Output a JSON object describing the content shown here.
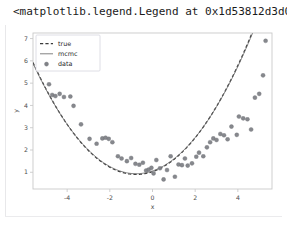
{
  "output": {
    "repr_text": "<matplotlib.legend.Legend at 0x1d53812d3d0>"
  },
  "colors": {
    "background": "#ffffff",
    "text": "#1a1a1a",
    "spine": "#c9c9c9",
    "tick_text": "#4d4d4d",
    "marker": "#808287",
    "marker_edge": "#6f7277",
    "true_line": "#3b3b3b",
    "mcmc_line": "#6a6a6a",
    "legend_border": "#d6d6de",
    "legend_face": "#ffffff",
    "cell_rule": "#e8e8ea"
  },
  "legend": {
    "entries": [
      {
        "label": "true",
        "style": "dashed-line",
        "color": "#3b3b3b"
      },
      {
        "label": "mcmc",
        "style": "solid-line",
        "color": "#6a6a6a"
      },
      {
        "label": "data",
        "style": "marker",
        "color": "#808287"
      }
    ]
  },
  "chart_data": {
    "type": "scatter",
    "title": "",
    "xlabel": "x",
    "ylabel": "y",
    "xlim": [
      -5.6,
      5.6
    ],
    "ylim": [
      0.25,
      7.25
    ],
    "xticks": [
      -4,
      -2,
      0,
      2,
      4
    ],
    "yticks": [
      1,
      2,
      3,
      4,
      5,
      6,
      7
    ],
    "xticklabels": [
      "-4",
      "-2",
      "0",
      "2",
      "4"
    ],
    "yticklabels": [
      "1",
      "2",
      "3",
      "4",
      "5",
      "6",
      "7"
    ],
    "grid": false,
    "legend_position": "upper left",
    "series": [
      {
        "name": "true",
        "type": "line",
        "linestyle": "dashed",
        "color": "#3b3b3b",
        "model": "quadratic",
        "coefficients": {
          "a": 0.215,
          "b": 0.33,
          "c": 1.03
        },
        "x": [
          -5.4,
          -4.9,
          -4.4,
          -3.9,
          -3.4,
          -2.9,
          -2.4,
          -1.9,
          -1.4,
          -0.9,
          -0.4,
          0.1,
          0.6,
          1.1,
          1.6,
          2.1,
          2.6,
          3.1,
          3.6,
          4.1,
          4.6,
          5.1,
          5.4
        ],
        "y": [
          5.52,
          4.57,
          3.74,
          3.01,
          2.39,
          1.88,
          1.48,
          1.18,
          0.99,
          0.91,
          0.93,
          1.07,
          1.31,
          1.65,
          2.11,
          2.67,
          3.34,
          4.12,
          5.01,
          6.0,
          7.1,
          8.3,
          9.05
        ]
      },
      {
        "name": "mcmc",
        "type": "line",
        "linestyle": "solid",
        "color": "#6a6a6a",
        "model": "quadratic",
        "coefficients": {
          "a": 0.212,
          "b": 0.325,
          "c": 1.06
        },
        "x": [
          -5.4,
          -4.9,
          -4.4,
          -3.9,
          -3.4,
          -2.9,
          -2.4,
          -1.9,
          -1.4,
          -0.9,
          -0.4,
          0.1,
          0.6,
          1.1,
          1.6,
          2.1,
          2.6,
          3.1,
          3.6,
          4.1,
          4.6,
          5.1,
          5.4
        ],
        "y": [
          5.48,
          4.54,
          3.73,
          3.02,
          2.41,
          1.9,
          1.5,
          1.21,
          1.02,
          0.94,
          0.96,
          1.09,
          1.33,
          1.67,
          2.12,
          2.67,
          3.33,
          4.1,
          4.97,
          5.95,
          7.03,
          8.21,
          8.95
        ]
      },
      {
        "name": "data",
        "type": "scatter",
        "marker": "o",
        "color": "#808287",
        "points": [
          [
            -5.15,
            5.7
          ],
          [
            -4.85,
            4.95
          ],
          [
            -4.7,
            4.47
          ],
          [
            -4.55,
            4.42
          ],
          [
            -4.35,
            4.52
          ],
          [
            -4.15,
            4.38
          ],
          [
            -3.85,
            4.4
          ],
          [
            -3.7,
            3.98
          ],
          [
            -3.35,
            3.15
          ],
          [
            -2.95,
            2.5
          ],
          [
            -2.62,
            2.28
          ],
          [
            -2.35,
            2.52
          ],
          [
            -2.2,
            2.55
          ],
          [
            -2.05,
            2.5
          ],
          [
            -1.88,
            2.35
          ],
          [
            -1.62,
            1.72
          ],
          [
            -1.45,
            1.62
          ],
          [
            -1.2,
            1.5
          ],
          [
            -1.0,
            1.64
          ],
          [
            -0.8,
            1.38
          ],
          [
            -0.62,
            1.34
          ],
          [
            -0.45,
            1.43
          ],
          [
            -0.3,
            1.08
          ],
          [
            -0.18,
            1.12
          ],
          [
            -0.05,
            1.2
          ],
          [
            0.05,
            0.95
          ],
          [
            0.18,
            1.55
          ],
          [
            0.35,
            1.18
          ],
          [
            0.52,
            0.68
          ],
          [
            0.68,
            1.1
          ],
          [
            0.85,
            1.72
          ],
          [
            1.05,
            0.8
          ],
          [
            1.22,
            1.35
          ],
          [
            1.38,
            1.32
          ],
          [
            1.52,
            1.62
          ],
          [
            1.65,
            1.3
          ],
          [
            1.85,
            1.4
          ],
          [
            2.05,
            1.7
          ],
          [
            2.18,
            1.88
          ],
          [
            2.38,
            1.72
          ],
          [
            2.55,
            2.12
          ],
          [
            2.7,
            2.35
          ],
          [
            2.85,
            2.52
          ],
          [
            3.0,
            2.45
          ],
          [
            3.18,
            2.72
          ],
          [
            3.35,
            2.66
          ],
          [
            3.52,
            2.48
          ],
          [
            3.7,
            3.05
          ],
          [
            3.95,
            2.68
          ],
          [
            4.05,
            3.5
          ],
          [
            4.25,
            3.42
          ],
          [
            4.45,
            3.38
          ],
          [
            4.62,
            2.92
          ],
          [
            4.8,
            4.35
          ],
          [
            5.0,
            4.52
          ],
          [
            5.18,
            5.35
          ],
          [
            5.3,
            6.9
          ]
        ]
      }
    ]
  }
}
